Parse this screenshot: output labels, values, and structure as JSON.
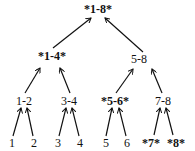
{
  "diagram": {
    "type": "tree",
    "nodes": [
      {
        "id": "n18",
        "label": "*1-8*",
        "bold": true,
        "x": 98,
        "y": 3
      },
      {
        "id": "n14",
        "label": "*1-4*",
        "bold": true,
        "x": 52,
        "y": 50
      },
      {
        "id": "n58",
        "label": "5-8",
        "bold": false,
        "x": 139,
        "y": 53
      },
      {
        "id": "n12",
        "label": "1-2",
        "bold": false,
        "x": 24,
        "y": 95
      },
      {
        "id": "n34",
        "label": "3-4",
        "bold": false,
        "x": 69,
        "y": 95
      },
      {
        "id": "n56",
        "label": "*5-6*",
        "bold": true,
        "x": 115,
        "y": 95
      },
      {
        "id": "n78",
        "label": "7-8",
        "bold": false,
        "x": 163,
        "y": 95
      },
      {
        "id": "l1",
        "label": "1",
        "bold": false,
        "x": 12,
        "y": 137
      },
      {
        "id": "l2",
        "label": "2",
        "bold": false,
        "x": 34,
        "y": 137
      },
      {
        "id": "l3",
        "label": "3",
        "bold": false,
        "x": 58,
        "y": 137
      },
      {
        "id": "l4",
        "label": "4",
        "bold": false,
        "x": 80,
        "y": 137
      },
      {
        "id": "l5",
        "label": "5",
        "bold": false,
        "x": 106,
        "y": 137
      },
      {
        "id": "l6",
        "label": "6",
        "bold": false,
        "x": 127,
        "y": 137
      },
      {
        "id": "l7",
        "label": "*7*",
        "bold": true,
        "x": 151,
        "y": 137
      },
      {
        "id": "l8",
        "label": "*8*",
        "bold": true,
        "x": 176,
        "y": 137
      }
    ],
    "edges": [
      {
        "from": "n14",
        "to": "n18",
        "x1": 53,
        "y1": 48,
        "x2": 91,
        "y2": 18
      },
      {
        "from": "n58",
        "to": "n18",
        "x1": 143,
        "y1": 52,
        "x2": 105,
        "y2": 18
      },
      {
        "from": "n12",
        "to": "n14",
        "x1": 25,
        "y1": 93,
        "x2": 40,
        "y2": 68
      },
      {
        "from": "n34",
        "to": "n14",
        "x1": 70,
        "y1": 93,
        "x2": 60,
        "y2": 68
      },
      {
        "from": "n56",
        "to": "n58",
        "x1": 116,
        "y1": 93,
        "x2": 133,
        "y2": 69
      },
      {
        "from": "n78",
        "to": "n58",
        "x1": 162,
        "y1": 93,
        "x2": 152,
        "y2": 69
      },
      {
        "from": "l1",
        "to": "n12",
        "x1": 13,
        "y1": 136,
        "x2": 21,
        "y2": 108
      },
      {
        "from": "l2",
        "to": "n12",
        "x1": 33,
        "y1": 136,
        "x2": 27,
        "y2": 108
      },
      {
        "from": "l3",
        "to": "n34",
        "x1": 59,
        "y1": 136,
        "x2": 66,
        "y2": 108
      },
      {
        "from": "l4",
        "to": "n34",
        "x1": 79,
        "y1": 136,
        "x2": 72,
        "y2": 108
      },
      {
        "from": "l5",
        "to": "n56",
        "x1": 106,
        "y1": 136,
        "x2": 112,
        "y2": 108
      },
      {
        "from": "l6",
        "to": "n56",
        "x1": 126,
        "y1": 136,
        "x2": 119,
        "y2": 108
      },
      {
        "from": "l7",
        "to": "n78",
        "x1": 154,
        "y1": 135,
        "x2": 160,
        "y2": 108
      },
      {
        "from": "l8",
        "to": "n78",
        "x1": 173,
        "y1": 135,
        "x2": 166,
        "y2": 108
      }
    ],
    "colors": {
      "ink": "#111111",
      "background": "#ffffff"
    }
  }
}
